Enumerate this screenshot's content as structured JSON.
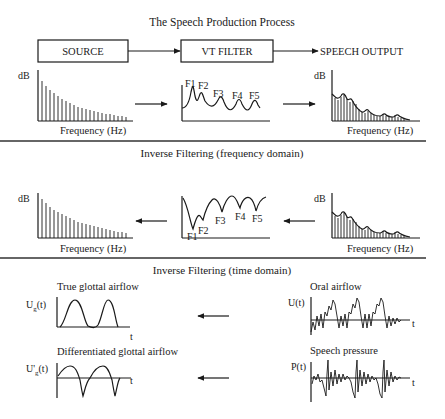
{
  "title": "The Speech Production Process",
  "production": {
    "source_label": "SOURCE",
    "filter_label": "VT FILTER",
    "output_label": "SPEECH OUTPUT",
    "source_spectrum": {
      "ylabel": "dB",
      "xlabel": "Frequency (Hz)"
    },
    "filter_response": {
      "formants": [
        "F1",
        "F2",
        "F3",
        "F4",
        "F5"
      ]
    },
    "output_spectrum": {
      "ylabel": "dB",
      "xlabel": "Frequency (Hz)"
    }
  },
  "freq_inverse": {
    "title": "Inverse Filtering (frequency domain)",
    "source_spectrum": {
      "ylabel": "dB",
      "xlabel": "Frequency (Hz)"
    },
    "inverse_filter": {
      "formants": [
        "F1",
        "F2",
        "F3",
        "F4",
        "F5"
      ]
    },
    "output_spectrum": {
      "ylabel": "dB",
      "xlabel": "Frequency (Hz)"
    }
  },
  "time_inverse": {
    "title": "Inverse Filtering (time domain)",
    "true_glottal": {
      "title": "True glottal airflow",
      "ylabel_main": "U",
      "ylabel_sub": "g",
      "ylabel_tail": "(t)",
      "xlabel": "t"
    },
    "diff_glottal": {
      "title": "Differentiated glottal airflow",
      "ylabel_main": "U'",
      "ylabel_sub": "g",
      "ylabel_tail": "(t)",
      "xlabel": "t"
    },
    "oral_airflow": {
      "title": "Oral airflow",
      "ylabel": "U(t)",
      "xlabel": "t"
    },
    "speech_pressure": {
      "title": "Speech pressure",
      "ylabel": "P(t)",
      "xlabel": "t"
    }
  },
  "icons": {
    "arrow_right": "arrow-right",
    "arrow_left": "arrow-left"
  }
}
